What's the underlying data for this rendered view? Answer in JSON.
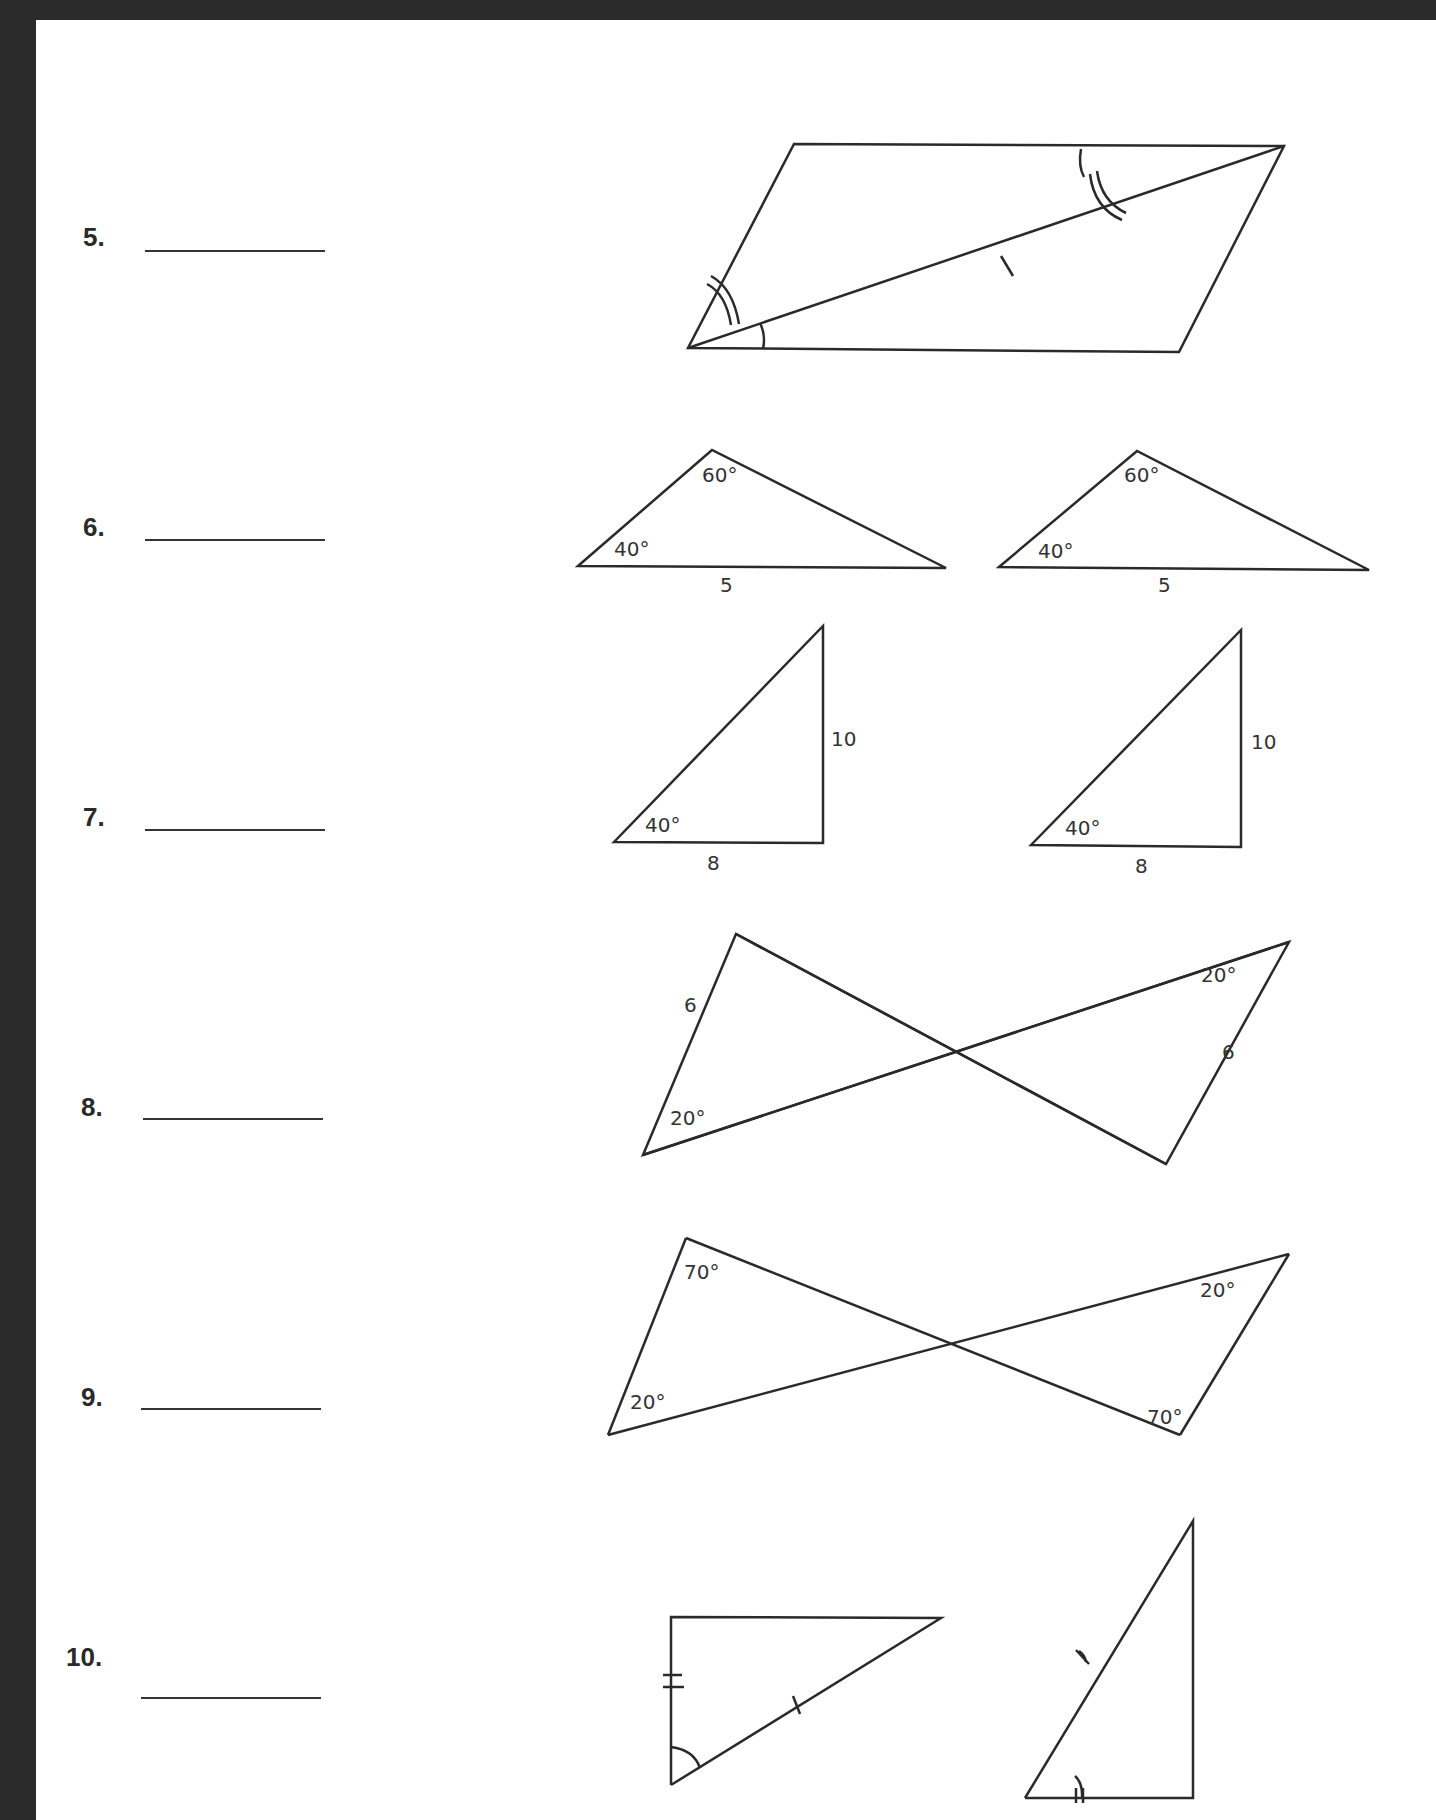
{
  "worksheet": {
    "problems": [
      {
        "number": "5.",
        "answer": "",
        "figure": "parallelogram-with-diagonal",
        "labels": []
      },
      {
        "number": "6.",
        "answer": "",
        "figure": "two-triangles-ASA",
        "labels": [
          "60°",
          "40°",
          "5",
          "60°",
          "40°",
          "5"
        ]
      },
      {
        "number": "7.",
        "answer": "",
        "figure": "two-right-triangles",
        "labels": [
          "10",
          "40°",
          "8",
          "10",
          "40°",
          "8"
        ]
      },
      {
        "number": "8.",
        "answer": "",
        "figure": "bowtie-triangles",
        "labels": [
          "6",
          "20°",
          "20°",
          "6"
        ]
      },
      {
        "number": "9.",
        "answer": "",
        "figure": "bowtie-triangles",
        "labels": [
          "70°",
          "20°",
          "20°",
          "70°"
        ]
      },
      {
        "number": "10.",
        "answer": "",
        "figure": "two-right-triangles-with-marks",
        "labels": []
      }
    ]
  },
  "fig6": {
    "a_top": "60°",
    "a_left": "40°",
    "a_side": "5",
    "b_top": "60°",
    "b_left": "40°",
    "b_side": "5"
  },
  "fig7": {
    "a_right": "10",
    "a_angle": "40°",
    "a_base": "8",
    "b_right": "10",
    "b_angle": "40°",
    "b_base": "8"
  },
  "fig8": {
    "left_side": "6",
    "left_angle": "20°",
    "right_angle": "20°",
    "right_side": "6"
  },
  "fig9": {
    "top_left": "70°",
    "bottom_left": "20°",
    "top_right": "20°",
    "bottom_right": "70°"
  }
}
